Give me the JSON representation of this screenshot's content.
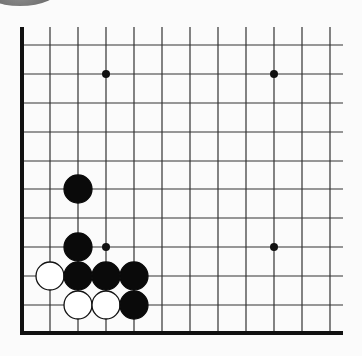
{
  "board": {
    "columns": 12,
    "rows": 11,
    "x_positions": [
      22,
      50,
      78,
      106,
      134,
      162,
      190,
      218,
      246,
      274,
      302,
      330
    ],
    "y_positions": [
      45,
      74,
      103,
      132,
      161,
      189,
      218,
      247,
      276,
      305
    ],
    "left_edge_x": 22,
    "bottom_edge_y": 333,
    "top_start_y": 27,
    "right_end_x": 343,
    "line_color": "#333333",
    "edge_color": "#111111",
    "stone_radius": 14
  },
  "star_points": [
    {
      "x": 106,
      "y": 74
    },
    {
      "x": 274,
      "y": 74
    },
    {
      "x": 106,
      "y": 247
    },
    {
      "x": 274,
      "y": 247
    }
  ],
  "stones": [
    {
      "color": "black",
      "x": 78,
      "y": 189
    },
    {
      "color": "black",
      "x": 78,
      "y": 247
    },
    {
      "color": "white",
      "x": 50,
      "y": 276
    },
    {
      "color": "black",
      "x": 78,
      "y": 276
    },
    {
      "color": "black",
      "x": 106,
      "y": 276
    },
    {
      "color": "black",
      "x": 134,
      "y": 276
    },
    {
      "color": "white",
      "x": 78,
      "y": 305
    },
    {
      "color": "white",
      "x": 106,
      "y": 305
    },
    {
      "color": "black",
      "x": 134,
      "y": 305
    }
  ],
  "colors": {
    "black_stone": "#0a0a0a",
    "white_stone": "#ffffff",
    "white_stone_outline": "#111111",
    "background": "#fbfbfb"
  }
}
